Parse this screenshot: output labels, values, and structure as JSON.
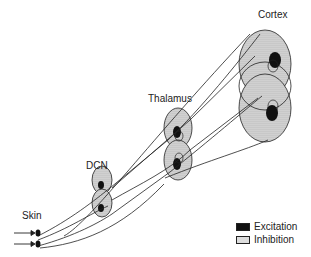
{
  "header": {
    "partial_text": ""
  },
  "diagram": {
    "stages": [
      {
        "id": "skin",
        "label": "Skin"
      },
      {
        "id": "dcn",
        "label": "DCN"
      },
      {
        "id": "thalamus",
        "label": "Thalamus"
      },
      {
        "id": "cortex",
        "label": "Cortex"
      }
    ],
    "input_arrows": 2
  },
  "legend": {
    "items": [
      {
        "label": "Excitation",
        "swatch": "solid-black"
      },
      {
        "label": "Inhibition",
        "swatch": "dotted-gray"
      }
    ]
  },
  "colors": {
    "excitation": "#111111",
    "inhibition_fill": "#dddddd",
    "stroke": "#222222"
  }
}
